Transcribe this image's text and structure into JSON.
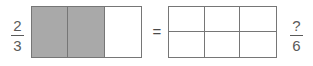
{
  "problem": {
    "type": "equivalent-fraction-model",
    "equals_symbol": "=",
    "left": {
      "fraction": {
        "numerator": "2",
        "denominator": "3"
      },
      "model": {
        "columns": 3,
        "rows": 1,
        "total_cells": 3,
        "shaded_cells": 2,
        "cells": [
          {
            "shaded": true
          },
          {
            "shaded": true
          },
          {
            "shaded": false
          }
        ]
      }
    },
    "right": {
      "fraction": {
        "numerator": "?",
        "denominator": "6"
      },
      "model": {
        "columns": 3,
        "rows": 2,
        "total_cells": 6,
        "shaded_cells": 0,
        "cells": [
          {
            "shaded": false
          },
          {
            "shaded": false
          },
          {
            "shaded": false
          },
          {
            "shaded": false
          },
          {
            "shaded": false
          },
          {
            "shaded": false
          }
        ]
      }
    }
  },
  "colors": {
    "shade": "#a9a9a9",
    "line": "#767676",
    "text": "#5a5a5a",
    "background": "#ffffff"
  }
}
